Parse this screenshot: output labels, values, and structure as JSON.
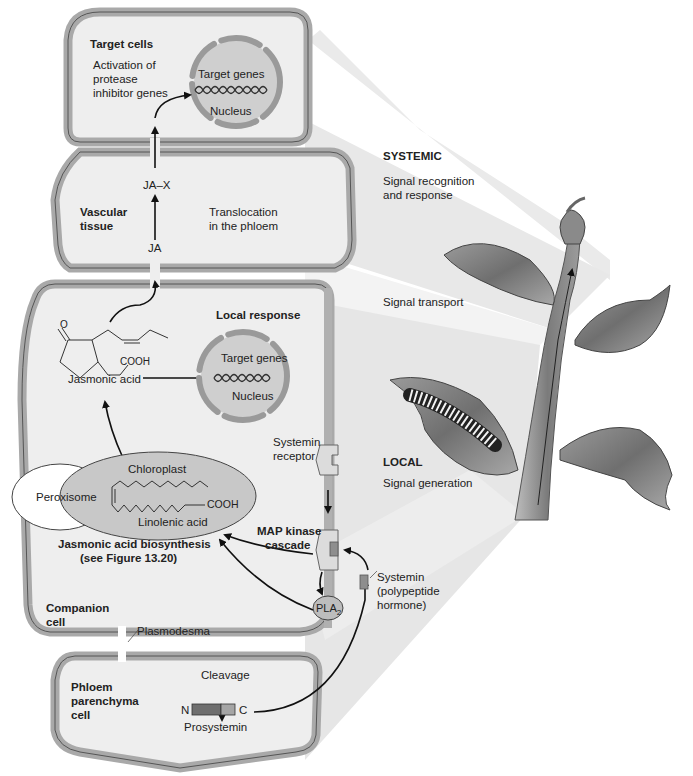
{
  "colors": {
    "cell_wall": "#a9a9a9",
    "cell_wall_line": "#555555",
    "cytoplasm": "#eeeeee",
    "nucleus_fill": "#cfcfcf",
    "nuclear_envelope": "#9a9a9a",
    "chloroplast_fill": "#c8c8c8",
    "peroxisome_fill": "#ffffff",
    "projection_shade": "#e6e6e6",
    "receptor_fill": "#dcdcdc",
    "systemin_fill": "#8e8e8e",
    "prosystemin_dark": "#6e6e6e",
    "prosystemin_light": "#a5a5a5",
    "arrow": "#111111"
  },
  "target_cell": {
    "title": "Target cells",
    "description_lines": [
      "Activation of",
      "protease",
      "inhibitor genes"
    ],
    "nucleus": {
      "genes_label": "Target genes",
      "label": "Nucleus"
    }
  },
  "vascular_tissue": {
    "title_lines": [
      "Vascular",
      "tissue"
    ],
    "conjugate_label": "JA–X",
    "ja_label": "JA",
    "translocation_lines": [
      "Translocation",
      "in the phloem"
    ]
  },
  "companion_cell": {
    "title_lines": [
      "Companion",
      "cell"
    ],
    "jasmonic_acid": {
      "label": "Jasmonic acid",
      "oxygen": "O",
      "carboxyl": "COOH"
    },
    "local_response": {
      "title": "Local response",
      "nucleus": {
        "genes_label": "Target genes",
        "label": "Nucleus"
      }
    },
    "peroxisome_label": "Peroxisome",
    "chloroplast": {
      "label": "Chloroplast",
      "molecule_label": "Linolenic acid",
      "carboxyl": "COOH"
    },
    "biosynthesis_lines": [
      "Jasmonic acid biosynthesis",
      "(see Figure 13.20)"
    ],
    "receptor_lines": [
      "Systemin",
      "receptor"
    ],
    "map_kinase_lines": [
      "MAP kinase",
      "cascade"
    ],
    "pla2": {
      "text": "PLA",
      "subscript": "2"
    }
  },
  "plasmodesma_label": "Plasmodesma",
  "systemin_lines": [
    "Systemin",
    "(polypeptide",
    "hormone)"
  ],
  "phloem_parenchyma": {
    "title_lines": [
      "Phloem",
      "parenchyma",
      "cell"
    ],
    "cleavage_label": "Cleavage",
    "n_terminus": "N",
    "c_terminus": "C",
    "prosystemin_label": "Prosystemin"
  },
  "plant_panel": {
    "systemic": {
      "title": "SYSTEMIC",
      "lines": [
        "Signal recognition",
        "and response"
      ]
    },
    "transport": "Signal transport",
    "local": {
      "title": "LOCAL",
      "subtitle": "Signal generation"
    }
  }
}
